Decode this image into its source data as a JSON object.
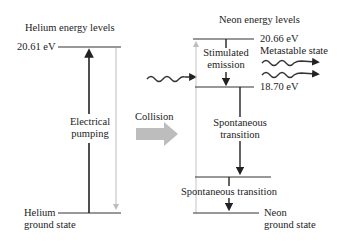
{
  "helium": {
    "title": "Helium energy levels",
    "upper_level_label": "20.61 eV",
    "ground_label_line1": "Helium",
    "ground_label_line2": "ground state",
    "pumping_line1": "Electrical",
    "pumping_line2": "pumping"
  },
  "collision": {
    "label": "Collision"
  },
  "neon": {
    "title": "Neon energy levels",
    "metastable_energy": "20.66 eV",
    "metastable_label": "Metastable state",
    "lower_laser_energy": "18.70 eV",
    "stimulated_line1": "Stimulated",
    "stimulated_line2": "emission",
    "spontaneous1_line1": "Spontaneous",
    "spontaneous1_line2": "transition",
    "spontaneous2": "Spontaneous transition",
    "ground_line1": "Neon",
    "ground_line2": "ground state"
  },
  "colors": {
    "line": "#222222",
    "gray_arrow": "#b8b8b8",
    "gray_line": "#bdbdbd"
  }
}
